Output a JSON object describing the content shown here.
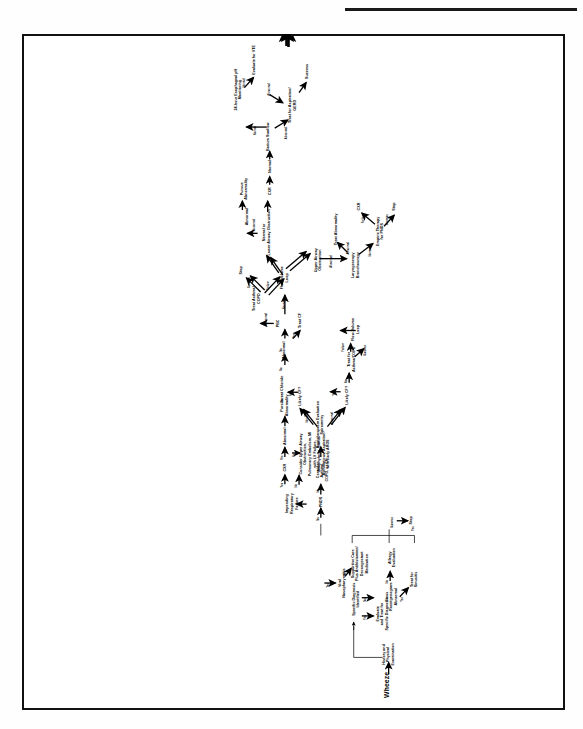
{
  "figure": {
    "title": "Wheeze",
    "domain": "clinical-algorithm-flowchart",
    "orientation": "rotated-90-ccw"
  },
  "nodes": {
    "start": "History and\nPhysical Examination",
    "specific_dx": "Specific Diagnosis Identified",
    "evaluate_treat": "Evaluate\nand Treat for\nSpecific Diagnosis",
    "viral_naso": "Viral\nNasopharyngitis",
    "supportive_care": "Supportive Care\nPlus Antihistamine/\nDecongestant Medication",
    "sinus_xray": "Sinus\nRoentgenogram\nAbnormal",
    "treat_sinusitis": "Treat for\nSinusitis",
    "allergy_eval": "Allergy Evaluation",
    "stop_left": "Stop",
    "consider_asthma": "Consider Asthma,\nCOPD, or CF",
    "pnds": "PNDS",
    "impending_rf": "Impending\nRespiratory\nFailure",
    "cxr_top": "CXR",
    "pursue_abn_top": "Pursue\nAbnormality",
    "consider_upper": "Consider Upper Airway\nObstruction,\nPulmonary Embolism, MI\nwith LV Failure,\nAnaphylaxis, Status\nAsthmaticus, Aspiration\nwith Early ARDS",
    "bronchospasm": "Bronchospasm Evaluation\nSpirometry",
    "likely_cf_upper": "Likely CF?",
    "likely_cf_lower": "Likely CF?",
    "sweat_chloride": "Sweat Chloride",
    "abnormal_node": "Abnormal",
    "treat_cf": "Treat CF",
    "pbc": "PBC",
    "treat_asthma_copd_upper": "Treat Asthma/\nCOPD",
    "treat_asthma_copd_lower": "Treat for\nAsthma/COPD",
    "stop_upper": "Stop",
    "stop_lower": "Stop",
    "flow_volume_upper": "Flow-Volume\nLoop",
    "flow_volume_lower": "Flow-Volume\nLoop",
    "normal_or_lower": "Normal or\nLower Airway Obstruction",
    "abnormal_branch": "Abnormal",
    "pursue_abnormality": "Pursue\nAbnormality",
    "upper_airway_obs": "Upper Airway\nObstruction",
    "laryngoscopy": "Laryngoscopy\nBronchoscopy",
    "treat_abnormality": "Treat Abnormality",
    "empiric_pnds": "Empiric Therapy\nfor PNDS",
    "stop_empiric": "Stop",
    "cxr_lower": "CXR",
    "cxr_main": "CXR",
    "normal_1": "Normal",
    "barium_swallow": "Barium Swallow",
    "normal_2": "Normal",
    "ph_monitoring": "24-hour Esophageal pH\nMonitoring",
    "evaluate_vte": "Evaluate for VTE",
    "treat_aspiration": "Treat for Aspiration/\nGERD",
    "success_end": "Success"
  },
  "edge_labels": {
    "yes_specific": "Yes",
    "no_specific": "No",
    "yes_viral": "Yes",
    "yes_viral2": "Yes",
    "no_sinus": "No",
    "yes_sinus": "Yes",
    "no_allergy": "No",
    "yes_allergy": "Yes",
    "success_allergy": "Success",
    "no_pnds": "No",
    "no_pnds2": "No",
    "yes_impending": "Yes",
    "no_impending": "No",
    "yes_cxr": "Yes",
    "no_cxr": "No",
    "normal_spiro": "Normal",
    "abnormal_spiro": "Abnormal",
    "yes_cf_upper": "Yes",
    "no_cf_upper": "No",
    "yes_cf_lower": "Yes",
    "no_cf_lower": "No",
    "no_sweat": "No",
    "yes_sweat": "Yes",
    "abnormal_pbc": "Abnormal",
    "normal_pbc": "Normal",
    "success_treat_upper": "Success",
    "failure_treat_upper": "Failure",
    "success_treat_lower": "Success",
    "failure_treat_lower": "Failure",
    "abnormal_flow": "Abnormal",
    "abnormal_laryngo": "Abnormal",
    "normal_laryngo": "Normal",
    "success_empiric": "Success",
    "failure_empiric": "Failure",
    "normal_barium": "Normal",
    "abnormal_barium": "Abnormal",
    "normal_ph": "Normal",
    "abnormal_ph": "Abnormal"
  },
  "colors": {
    "ink": "#000000",
    "paper": "#ffffff",
    "frame": "#111111"
  }
}
